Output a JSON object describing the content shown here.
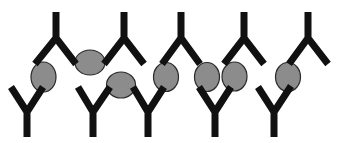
{
  "diagram": {
    "title": "",
    "colors": {
      "background": "#ffffff",
      "antibody": "#111111",
      "antigen_fill": "#8c8c8c",
      "antigen_stroke": "#2a2a2a"
    },
    "antibodies_top": [
      {
        "stem_x": 56,
        "stem_top": 12,
        "fork_y": 38,
        "left_tip": [
          35,
          64
        ],
        "right_tip": [
          76,
          64
        ]
      },
      {
        "stem_x": 124,
        "stem_top": 12,
        "fork_y": 38,
        "left_tip": [
          104,
          64
        ],
        "right_tip": [
          144,
          64
        ]
      },
      {
        "stem_x": 181,
        "stem_top": 12,
        "fork_y": 38,
        "left_tip": [
          162,
          64
        ],
        "right_tip": [
          200,
          64
        ]
      },
      {
        "stem_x": 244,
        "stem_top": 12,
        "fork_y": 38,
        "left_tip": [
          224,
          64
        ],
        "right_tip": [
          264,
          64
        ]
      },
      {
        "stem_x": 308,
        "stem_top": 12,
        "fork_y": 38,
        "left_tip": [
          289,
          64
        ],
        "right_tip": [
          328,
          64
        ]
      }
    ],
    "antibodies_bottom": [
      {
        "stem_x": 27,
        "stem_bottom": 137,
        "fork_y": 112,
        "left_tip": [
          11,
          87
        ],
        "right_tip": [
          43,
          87
        ]
      },
      {
        "stem_x": 93,
        "stem_bottom": 137,
        "fork_y": 112,
        "left_tip": [
          78,
          87
        ],
        "right_tip": [
          110,
          87
        ]
      },
      {
        "stem_x": 148,
        "stem_bottom": 137,
        "fork_y": 112,
        "left_tip": [
          133,
          87
        ],
        "right_tip": [
          164,
          87
        ]
      },
      {
        "stem_x": 215,
        "stem_bottom": 137,
        "fork_y": 112,
        "left_tip": [
          199,
          87
        ],
        "right_tip": [
          231,
          87
        ]
      },
      {
        "stem_x": 274,
        "stem_bottom": 137,
        "fork_y": 112,
        "left_tip": [
          258,
          87
        ],
        "right_tip": [
          291,
          86
        ]
      }
    ],
    "antigens": [
      {
        "cx": 43.5,
        "cy": 77,
        "rx": 12.5,
        "ry": 15
      },
      {
        "cx": 90,
        "cy": 62.5,
        "rx": 15,
        "ry": 12.5
      },
      {
        "cx": 121,
        "cy": 85,
        "rx": 14.5,
        "ry": 13
      },
      {
        "cx": 166,
        "cy": 77,
        "rx": 12.5,
        "ry": 14.5
      },
      {
        "cx": 207,
        "cy": 77,
        "rx": 12.5,
        "ry": 14.5
      },
      {
        "cx": 234.5,
        "cy": 76.5,
        "rx": 12.5,
        "ry": 14.5
      },
      {
        "cx": 288,
        "cy": 77,
        "rx": 12.5,
        "ry": 14.5
      }
    ]
  }
}
